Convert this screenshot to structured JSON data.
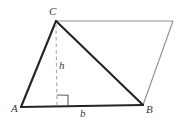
{
  "figure": {
    "type": "geometry-diagram",
    "canvas": {
      "width": 180,
      "height": 127,
      "background": "#ffffff"
    },
    "colors": {
      "emphasis_stroke": "#242424",
      "light_stroke": "#8e8e8e",
      "dashed_stroke": "#a8a8a8",
      "label_text": "#3a3a3a",
      "right_angle_stroke": "#5a5a5a"
    },
    "vertices": [
      {
        "id": "A",
        "label": "A",
        "x": 21,
        "y": 107
      },
      {
        "id": "B",
        "label": "B",
        "x": 143,
        "y": 105
      },
      {
        "id": "C",
        "label": "C",
        "x": 56,
        "y": 21
      },
      {
        "id": "D",
        "label": "",
        "x": 173,
        "y": 21
      }
    ],
    "edges": [
      {
        "id": "AC",
        "from": "A",
        "to": "C",
        "style": "solid",
        "weight": "thick"
      },
      {
        "id": "CD",
        "from": "C",
        "to": "D",
        "style": "solid",
        "weight": "thin"
      },
      {
        "id": "DB",
        "from": "D",
        "to": "B",
        "style": "solid",
        "weight": "thin"
      },
      {
        "id": "AB",
        "from": "A",
        "to": "B",
        "style": "solid",
        "weight": "thick"
      },
      {
        "id": "CB",
        "from": "C",
        "to": "B",
        "style": "solid",
        "weight": "thick"
      }
    ],
    "altitude": {
      "label": "h",
      "style": "dashed",
      "from": {
        "x": 56,
        "y": 24
      },
      "to": {
        "x": 57,
        "y": 106
      },
      "label_x": 59,
      "label_y": 60
    },
    "base": {
      "label": "b",
      "label_x": 80,
      "label_y": 108
    },
    "right_angle_marker": {
      "x": 57,
      "y": 95,
      "size": 11
    }
  }
}
